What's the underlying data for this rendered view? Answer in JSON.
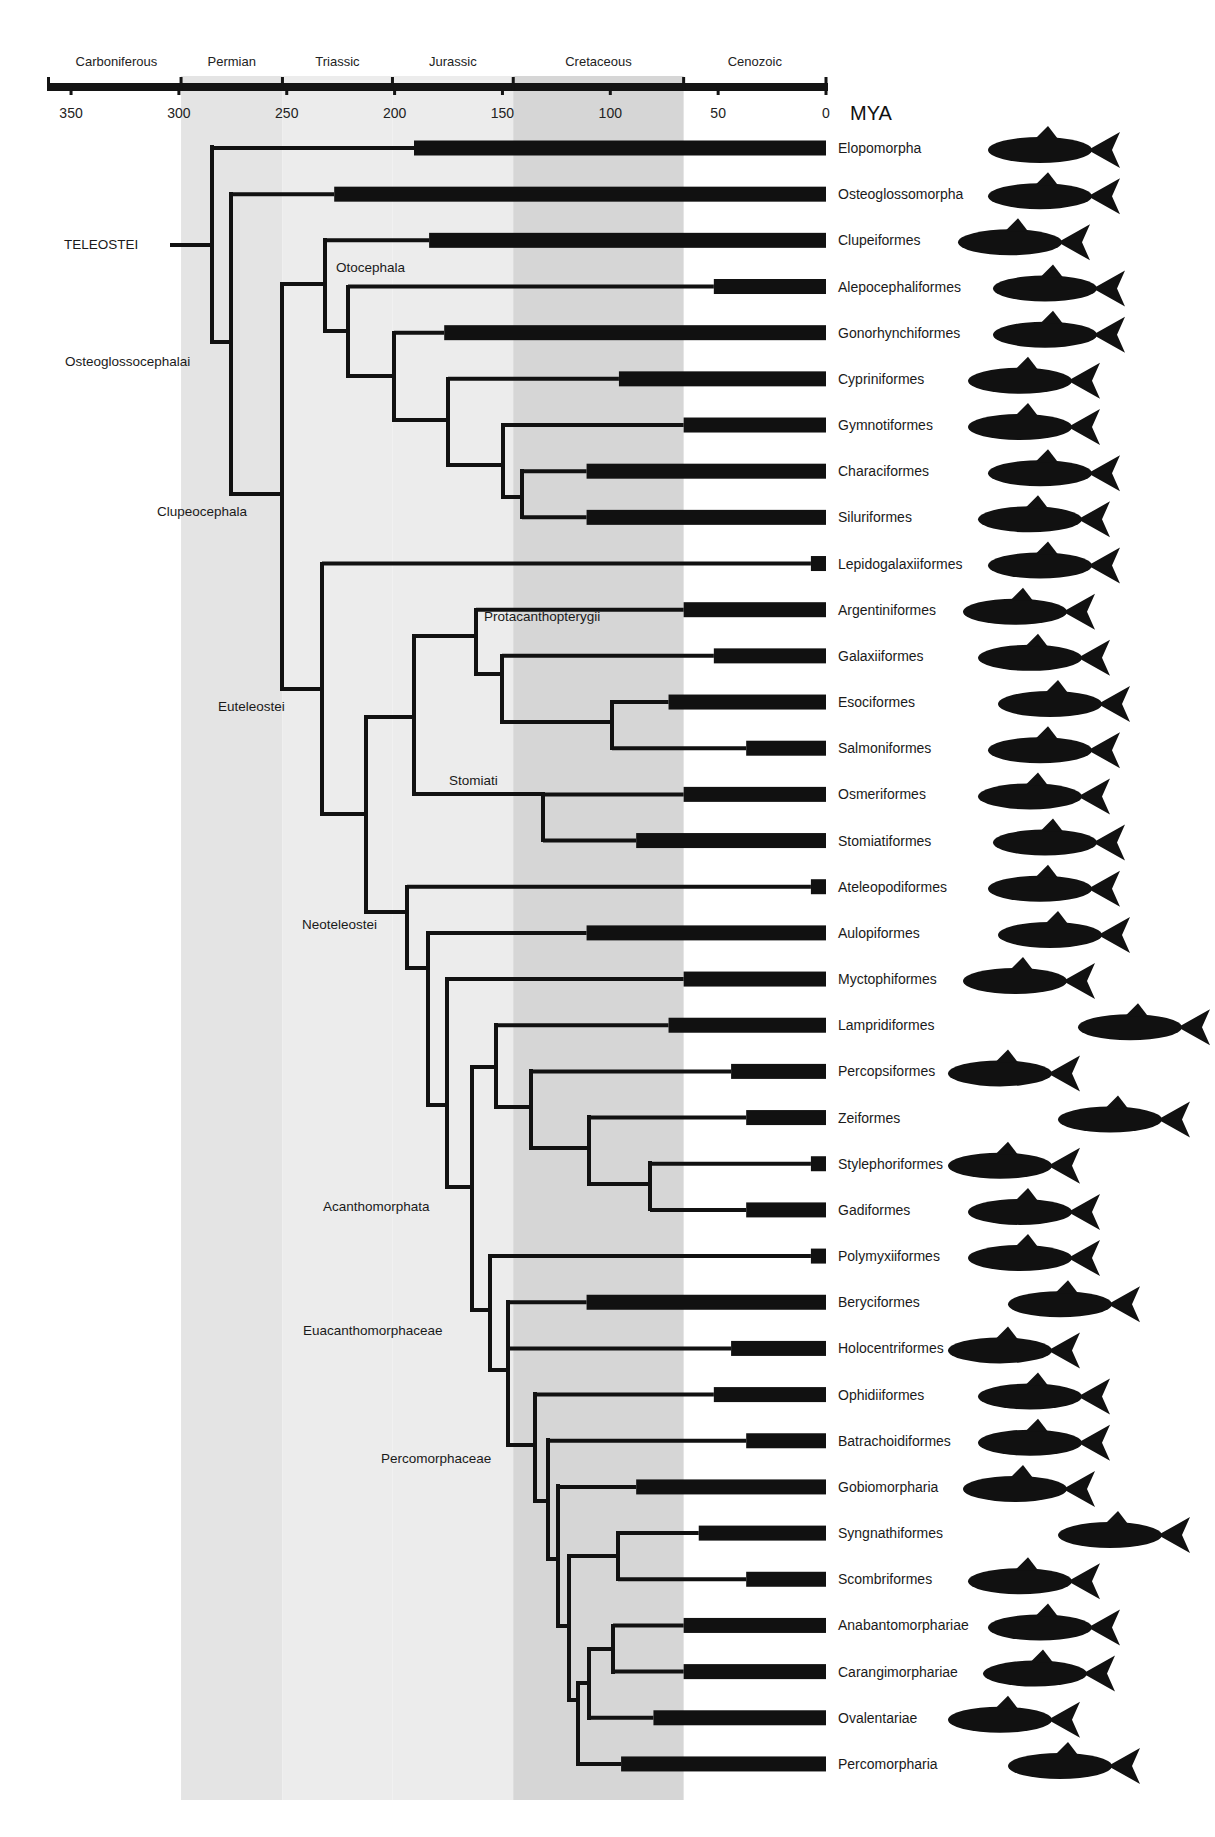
{
  "figure": {
    "axis_unit": "MYA",
    "periods": [
      {
        "name": "Carboniferous",
        "from": 359,
        "to": 299,
        "shade": "#ffffff"
      },
      {
        "name": "Permian",
        "from": 299,
        "to": 252,
        "shade": "#e4e4e4"
      },
      {
        "name": "Triassic",
        "from": 252,
        "to": 201,
        "shade": "#ececec"
      },
      {
        "name": "Jurassic",
        "from": 201,
        "to": 145,
        "shade": "#ececec"
      },
      {
        "name": "Cretaceous",
        "from": 145,
        "to": 66,
        "shade": "#d6d6d6"
      },
      {
        "name": "Cenozoic",
        "from": 66,
        "to": 0,
        "shade": "#ffffff"
      }
    ],
    "ticks": [
      350,
      300,
      250,
      200,
      150,
      100,
      50,
      0
    ],
    "clade_labels": [
      {
        "name": "TELEOSTEI",
        "x": 64,
        "y": 249
      },
      {
        "name": "Osteoglossocephalai",
        "x": 65,
        "y": 366
      },
      {
        "name": "Otocephala",
        "x": 336,
        "y": 272
      },
      {
        "name": "Clupeocephala",
        "x": 157,
        "y": 516
      },
      {
        "name": "Euteleostei",
        "x": 218,
        "y": 711
      },
      {
        "name": "Protacanthopterygii",
        "x": 484,
        "y": 621
      },
      {
        "name": "Stomiati",
        "x": 449,
        "y": 785
      },
      {
        "name": "Neoteleostei",
        "x": 302,
        "y": 929
      },
      {
        "name": "Acanthomorphata",
        "x": 323,
        "y": 1211
      },
      {
        "name": "Euacanthomorphaceae",
        "x": 303,
        "y": 1335
      },
      {
        "name": "Percomorphaceae",
        "x": 381,
        "y": 1463
      }
    ]
  },
  "chart_data": {
    "type": "phylogenetic-tree",
    "title": "",
    "xlabel": "MYA",
    "xlim": [
      360,
      0
    ],
    "x_ticks": [
      350,
      300,
      250,
      200,
      150,
      100,
      50,
      0
    ],
    "periods": [
      "Carboniferous",
      "Permian",
      "Triassic",
      "Jurassic",
      "Cretaceous",
      "Cenozoic"
    ],
    "taxa": [
      {
        "name": "Elopomorpha",
        "bar_start_mya": 191
      },
      {
        "name": "Osteoglossomorpha",
        "bar_start_mya": 228
      },
      {
        "name": "Clupeiformes",
        "bar_start_mya": 184
      },
      {
        "name": "Alepocephaliformes",
        "bar_start_mya": 52
      },
      {
        "name": "Gonorhynchiformes",
        "bar_start_mya": 177
      },
      {
        "name": "Cypriniformes",
        "bar_start_mya": 96
      },
      {
        "name": "Gymnotiformes",
        "bar_start_mya": 66
      },
      {
        "name": "Characiformes",
        "bar_start_mya": 111
      },
      {
        "name": "Siluriformes",
        "bar_start_mya": 111
      },
      {
        "name": "Lepidogalaxiiformes",
        "bar_start_mya": 7
      },
      {
        "name": "Argentiniformes",
        "bar_start_mya": 66
      },
      {
        "name": "Galaxiiformes",
        "bar_start_mya": 52
      },
      {
        "name": "Esociformes",
        "bar_start_mya": 73
      },
      {
        "name": "Salmoniformes",
        "bar_start_mya": 37
      },
      {
        "name": "Osmeriformes",
        "bar_start_mya": 66
      },
      {
        "name": "Stomiatiformes",
        "bar_start_mya": 88
      },
      {
        "name": "Ateleopodiformes",
        "bar_start_mya": 7
      },
      {
        "name": "Aulopiformes",
        "bar_start_mya": 111
      },
      {
        "name": "Myctophiformes",
        "bar_start_mya": 66
      },
      {
        "name": "Lampridiformes",
        "bar_start_mya": 73
      },
      {
        "name": "Percopsiformes",
        "bar_start_mya": 44
      },
      {
        "name": "Zeiformes",
        "bar_start_mya": 37
      },
      {
        "name": "Stylephoriformes",
        "bar_start_mya": 7
      },
      {
        "name": "Gadiformes",
        "bar_start_mya": 37
      },
      {
        "name": "Polymyxiiformes",
        "bar_start_mya": 7
      },
      {
        "name": "Beryciformes",
        "bar_start_mya": 111
      },
      {
        "name": "Holocentriformes",
        "bar_start_mya": 44
      },
      {
        "name": "Ophidiiformes",
        "bar_start_mya": 52
      },
      {
        "name": "Batrachoidiformes",
        "bar_start_mya": 37
      },
      {
        "name": "Gobiomorpharia",
        "bar_start_mya": 88
      },
      {
        "name": "Syngnathiformes",
        "bar_start_mya": 59
      },
      {
        "name": "Scombriformes",
        "bar_start_mya": 37
      },
      {
        "name": "Anabantomorphariae",
        "bar_start_mya": 66
      },
      {
        "name": "Carangimorphariae",
        "bar_start_mya": 66
      },
      {
        "name": "Ovalentariae",
        "bar_start_mya": 80
      },
      {
        "name": "Percomorpharia",
        "bar_start_mya": 95
      }
    ]
  },
  "layout": {
    "x0": 826,
    "px_per_mya": 2.157,
    "row_y0": 148,
    "row_step": 46.17,
    "bar_height": 15,
    "label_x": 838,
    "nodes": [
      {
        "x": 212,
        "y1": 147,
        "y2": 342,
        "stem_from": 170,
        "stem_y": 245,
        "kids": [
          {
            "row": 0
          },
          {
            "y": 342
          }
        ]
      },
      {
        "x": 231,
        "y1": 194,
        "y2": 494,
        "kids": [
          {
            "row": 1
          },
          {
            "y": 494
          }
        ]
      },
      {
        "x": 282,
        "y1": 284,
        "y2": 689,
        "kids": [
          {
            "y": 284
          },
          {
            "y": 689
          }
        ]
      },
      {
        "x": 325,
        "y1": 240,
        "y2": 331,
        "kids": [
          {
            "row": 2
          },
          {
            "y": 331
          }
        ]
      },
      {
        "x": 348,
        "y1": 287,
        "y2": 376,
        "kids": [
          {
            "row": 3
          },
          {
            "y": 376
          }
        ]
      },
      {
        "x": 394,
        "y1": 333,
        "y2": 420,
        "kids": [
          {
            "row": 4
          },
          {
            "y": 420
          }
        ]
      },
      {
        "x": 448,
        "y1": 379,
        "y2": 465,
        "kids": [
          {
            "row": 5
          },
          {
            "y": 465
          }
        ]
      },
      {
        "x": 503,
        "y1": 425,
        "y2": 497,
        "kids": [
          {
            "row": 6
          },
          {
            "y": 497
          }
        ]
      },
      {
        "x": 522,
        "y1": 471,
        "y2": 517,
        "kids": [
          {
            "row": 7
          },
          {
            "row": 8
          }
        ]
      },
      {
        "x": 322,
        "y1": 564,
        "y2": 814,
        "kids": [
          {
            "row": 9
          },
          {
            "y": 814
          }
        ]
      },
      {
        "x": 366,
        "y1": 717,
        "y2": 912,
        "kids": [
          {
            "y": 717
          },
          {
            "y": 912
          }
        ]
      },
      {
        "x": 414,
        "y1": 636,
        "y2": 794,
        "kids": [
          {
            "y": 636
          },
          {
            "y": 794
          }
        ]
      },
      {
        "x": 476,
        "y1": 610,
        "y2": 674,
        "kids": [
          {
            "row": 10
          },
          {
            "y": 674
          }
        ]
      },
      {
        "x": 502,
        "y1": 656,
        "y2": 722,
        "kids": [
          {
            "row": 11
          },
          {
            "y": 722
          }
        ]
      },
      {
        "x": 612,
        "y1": 702,
        "y2": 748,
        "kids": [
          {
            "row": 12
          },
          {
            "row": 13
          }
        ]
      },
      {
        "x": 543,
        "y1": 794,
        "y2": 840,
        "kids": [
          {
            "row": 14
          },
          {
            "row": 15
          }
        ]
      },
      {
        "x": 407,
        "y1": 887,
        "y2": 968,
        "kids": [
          {
            "row": 16
          },
          {
            "y": 968
          }
        ]
      },
      {
        "x": 428,
        "y1": 933,
        "y2": 1105,
        "kids": [
          {
            "row": 17
          },
          {
            "y": 1105
          }
        ]
      },
      {
        "x": 447,
        "y1": 979,
        "y2": 1187,
        "kids": [
          {
            "row": 18
          },
          {
            "y": 1187
          }
        ]
      },
      {
        "x": 472,
        "y1": 1067,
        "y2": 1310,
        "kids": [
          {
            "y": 1067
          },
          {
            "y": 1310
          }
        ]
      },
      {
        "x": 496,
        "y1": 1025,
        "y2": 1107,
        "kids": [
          {
            "row": 19
          },
          {
            "y": 1107
          }
        ]
      },
      {
        "x": 531,
        "y1": 1071,
        "y2": 1148,
        "kids": [
          {
            "row": 20
          },
          {
            "y": 1148
          }
        ]
      },
      {
        "x": 589,
        "y1": 1117,
        "y2": 1184,
        "kids": [
          {
            "row": 21
          },
          {
            "y": 1184
          }
        ]
      },
      {
        "x": 650,
        "y1": 1163,
        "y2": 1209,
        "kids": [
          {
            "row": 22
          },
          {
            "row": 23
          }
        ]
      },
      {
        "x": 490,
        "y1": 1256,
        "y2": 1370,
        "kids": [
          {
            "row": 24
          },
          {
            "y": 1370
          }
        ]
      },
      {
        "x": 508,
        "y1": 1302,
        "y2": 1445,
        "kids": [
          {
            "row": 25
          },
          {
            "row": 26
          },
          {
            "y": 1445
          }
        ]
      },
      {
        "x": 535,
        "y1": 1394,
        "y2": 1501,
        "kids": [
          {
            "row": 27
          },
          {
            "y": 1501
          }
        ]
      },
      {
        "x": 548,
        "y1": 1440,
        "y2": 1559,
        "kids": [
          {
            "row": 28
          },
          {
            "y": 1559
          }
        ]
      },
      {
        "x": 558,
        "y1": 1486,
        "y2": 1626,
        "kids": [
          {
            "row": 29
          },
          {
            "y": 1626
          }
        ]
      },
      {
        "x": 569,
        "y1": 1556,
        "y2": 1700,
        "kids": [
          {
            "y": 1556
          },
          {
            "y": 1700
          }
        ]
      },
      {
        "x": 618,
        "y1": 1533,
        "y2": 1579,
        "kids": [
          {
            "row": 30
          },
          {
            "row": 31
          }
        ]
      },
      {
        "x": 578,
        "y1": 1683,
        "y2": 1764,
        "kids": [
          {
            "y": 1683
          },
          {
            "row": 35
          }
        ]
      },
      {
        "x": 589,
        "y1": 1649,
        "y2": 1718,
        "kids": [
          {
            "y": 1649
          },
          {
            "row": 34
          }
        ]
      },
      {
        "x": 613,
        "y1": 1626,
        "y2": 1672,
        "kids": [
          {
            "row": 32
          },
          {
            "row": 33
          }
        ]
      }
    ]
  }
}
